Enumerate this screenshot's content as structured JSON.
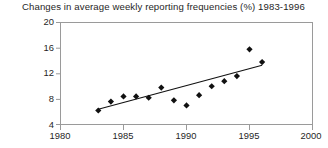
{
  "chart_data": {
    "type": "scatter",
    "title": "Changes in average weekly reporting frequencies (%) 1983-1996",
    "xlabel": "",
    "ylabel": "",
    "x": [
      1983,
      1984,
      1985,
      1986,
      1987,
      1988,
      1989,
      1990,
      1991,
      1992,
      1993,
      1994,
      1995,
      1996
    ],
    "values": [
      6.2,
      7.6,
      8.4,
      8.4,
      8.2,
      9.8,
      7.8,
      7.0,
      8.6,
      10.0,
      10.8,
      11.6,
      15.8,
      13.8
    ],
    "series": [
      {
        "name": "Average weekly reporting frequency change (%)",
        "values": [
          6.2,
          7.6,
          8.4,
          8.4,
          8.2,
          9.8,
          7.8,
          7.0,
          8.6,
          10.0,
          10.8,
          11.6,
          15.8,
          13.8
        ]
      }
    ],
    "trendline": {
      "name": "linear fit",
      "x_start": 1983,
      "y_start": 6.4,
      "x_end": 1996,
      "y_end": 13.3
    },
    "xlim": [
      1980,
      2000
    ],
    "ylim": [
      4,
      20
    ],
    "xticks": [
      1980,
      1985,
      1990,
      1995,
      2000
    ],
    "yticks": [
      4,
      8,
      12,
      16,
      20
    ],
    "xtick_labels": [
      "1980",
      "1985",
      "1990",
      "1995",
      "2000"
    ],
    "ytick_labels": [
      "4",
      "8",
      "12",
      "16",
      "20"
    ],
    "grid": false,
    "legend": "none",
    "marker": "diamond",
    "marker_color": "#111111",
    "line_color": "#111111",
    "axis_color": "#9a9a9a"
  }
}
